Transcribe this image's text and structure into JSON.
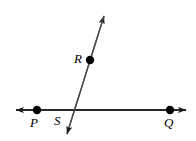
{
  "figure": {
    "width": 196,
    "height": 141,
    "background_color": "#ffffff",
    "stroke_color": "#1a1a1a",
    "point_color": "#000000"
  },
  "labels": {
    "p": "P",
    "s": "S",
    "q": "Q",
    "r": "R"
  },
  "chart_data": {
    "type": "scatter",
    "title": "",
    "xlabel": "",
    "ylabel": "",
    "xlim": [
      0,
      196
    ],
    "ylim": [
      0,
      141
    ],
    "grid": false,
    "legend": "none",
    "points": [
      {
        "name": "P",
        "x": 37,
        "y": 110,
        "label": "P",
        "label_x": 35,
        "label_y": 123,
        "radius": 4.2
      },
      {
        "name": "S",
        "x": 70,
        "y": 110,
        "label": "S",
        "label_x": 59,
        "label_y": 121,
        "radius": 0
      },
      {
        "name": "Q",
        "x": 170,
        "y": 110,
        "label": "Q",
        "label_x": 169,
        "label_y": 123,
        "radius": 4.2
      },
      {
        "name": "R",
        "x": 90,
        "y": 60,
        "label": "R",
        "label_x": 79,
        "label_y": 59,
        "radius": 4.2
      }
    ],
    "lines": [
      {
        "name": "horizontal-line-PQ",
        "x1": 16,
        "y1": 110,
        "x2": 186,
        "y2": 110,
        "arrow_start": true,
        "arrow_end": true,
        "stroke_width": 1.3
      },
      {
        "name": "diagonal-line-R",
        "x1": 104,
        "y1": 16,
        "x2": 67,
        "y2": 134,
        "arrow_start": true,
        "arrow_end": true,
        "stroke_width": 1.3
      }
    ]
  }
}
